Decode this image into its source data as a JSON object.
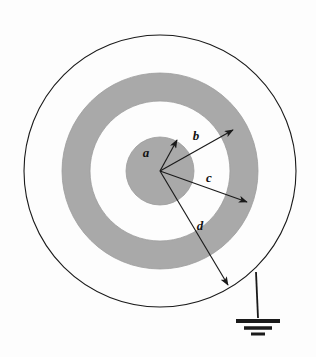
{
  "figure": {
    "background_color": "#fdfdfd",
    "ink_color": "#1a1a1a",
    "shaded_color": "#a8a8a8",
    "shaded_edge_color": "#9c9c9c"
  },
  "geometry": {
    "center": {
      "x": 160,
      "y": 171
    },
    "inner_core": {
      "name": "inner-solid-sphere",
      "radius": 34,
      "fill": "#a9a9a9"
    },
    "shell": {
      "name": "conducting-shell",
      "inner_radius": 70,
      "outer_radius": 98,
      "fill": "#a9a9a9"
    },
    "outer_boundary": {
      "name": "outer-circle",
      "radius": 136,
      "stroke_width": 1.1
    }
  },
  "radius_arrows": [
    {
      "id": "a",
      "label": "a",
      "description": "radius of inner solid sphere",
      "from": {
        "x": 160,
        "y": 171
      },
      "to": {
        "x": 177,
        "y": 140
      },
      "label_pos": {
        "x": 146,
        "y": 157
      }
    },
    {
      "id": "b",
      "label": "b",
      "description": "inner radius of conducting shell",
      "from": {
        "x": 160,
        "y": 171
      },
      "to": {
        "x": 233,
        "y": 130
      },
      "label_pos": {
        "x": 196,
        "y": 140
      }
    },
    {
      "id": "c",
      "label": "c",
      "description": "outer radius of conducting shell",
      "from": {
        "x": 160,
        "y": 171
      },
      "to": {
        "x": 247,
        "y": 202
      },
      "label_pos": {
        "x": 209,
        "y": 182
      }
    },
    {
      "id": "d",
      "label": "d",
      "description": "radius of outer boundary",
      "from": {
        "x": 160,
        "y": 171
      },
      "to": {
        "x": 228,
        "y": 285
      },
      "label_pos": {
        "x": 200,
        "y": 230
      }
    }
  ],
  "ground_symbol": {
    "name": "ground-symbol",
    "description": "earth ground connected to outer conductor",
    "wire": {
      "x1": 256,
      "y1": 272,
      "x2": 258,
      "y2": 318
    },
    "bars": [
      {
        "y": 321,
        "half_width": 22,
        "thickness": 4
      },
      {
        "y": 328,
        "half_width": 14,
        "thickness": 3.5
      },
      {
        "y": 334,
        "half_width": 7,
        "thickness": 3
      }
    ]
  }
}
